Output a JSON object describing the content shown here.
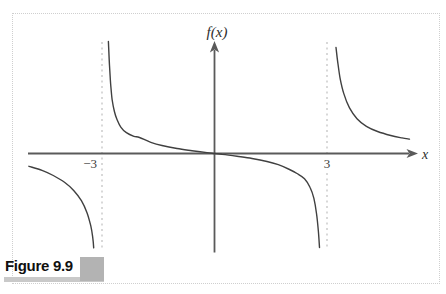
{
  "figure": {
    "caption": "Figure 9.9"
  },
  "chart_data": {
    "type": "line",
    "title": "",
    "xlabel": "x",
    "ylabel": "f(x)",
    "x_ticks": [
      {
        "value": -3,
        "label": "−3"
      },
      {
        "value": 3,
        "label": "3"
      }
    ],
    "vertical_asymptotes": [
      -3,
      3
    ],
    "horizontal_asymptote_y": 0,
    "xlim": [
      -5.1,
      5.45
    ],
    "ylim": [
      -2.8,
      2.9
    ],
    "grid": false,
    "legend": null,
    "colors": {
      "curve": "#404040",
      "axis": "#5a5a5a",
      "asymptote": "#b8b8b8"
    },
    "branches": [
      [
        [
          -4.95,
          -0.32
        ],
        [
          -4.6,
          -0.42
        ],
        [
          -4.3,
          -0.55
        ],
        [
          -4.0,
          -0.72
        ],
        [
          -3.75,
          -0.93
        ],
        [
          -3.55,
          -1.18
        ],
        [
          -3.4,
          -1.48
        ],
        [
          -3.3,
          -1.81
        ],
        [
          -3.25,
          -2.07
        ],
        [
          -3.22,
          -2.36
        ]
      ],
      [
        [
          -2.83,
          2.8
        ],
        [
          -2.8,
          2.2
        ],
        [
          -2.77,
          1.75
        ],
        [
          -2.73,
          1.35
        ],
        [
          -2.67,
          1.05
        ],
        [
          -2.6,
          0.85
        ],
        [
          -2.5,
          0.66
        ],
        [
          -2.35,
          0.52
        ],
        [
          -2.15,
          0.43
        ],
        [
          -2.0,
          0.4
        ],
        [
          -1.7,
          0.28
        ],
        [
          -1.4,
          0.2
        ],
        [
          -1.0,
          0.125
        ],
        [
          -0.6,
          0.07
        ],
        [
          -0.2,
          0.022
        ],
        [
          0,
          0
        ],
        [
          0.2,
          -0.022
        ],
        [
          0.6,
          -0.07
        ],
        [
          1.0,
          -0.125
        ],
        [
          1.4,
          -0.2
        ],
        [
          1.7,
          -0.28
        ],
        [
          2.0,
          -0.4
        ],
        [
          2.2,
          -0.5
        ],
        [
          2.4,
          -0.63
        ],
        [
          2.55,
          -0.85
        ],
        [
          2.65,
          -1.12
        ],
        [
          2.72,
          -1.5
        ],
        [
          2.77,
          -1.95
        ],
        [
          2.8,
          -2.35
        ]
      ],
      [
        [
          3.24,
          2.65
        ],
        [
          3.28,
          2.33
        ],
        [
          3.35,
          1.88
        ],
        [
          3.45,
          1.49
        ],
        [
          3.6,
          1.14
        ],
        [
          3.8,
          0.87
        ],
        [
          4.05,
          0.68
        ],
        [
          4.35,
          0.55
        ],
        [
          4.7,
          0.45
        ],
        [
          5.0,
          0.39
        ],
        [
          5.2,
          0.36
        ]
      ]
    ]
  }
}
